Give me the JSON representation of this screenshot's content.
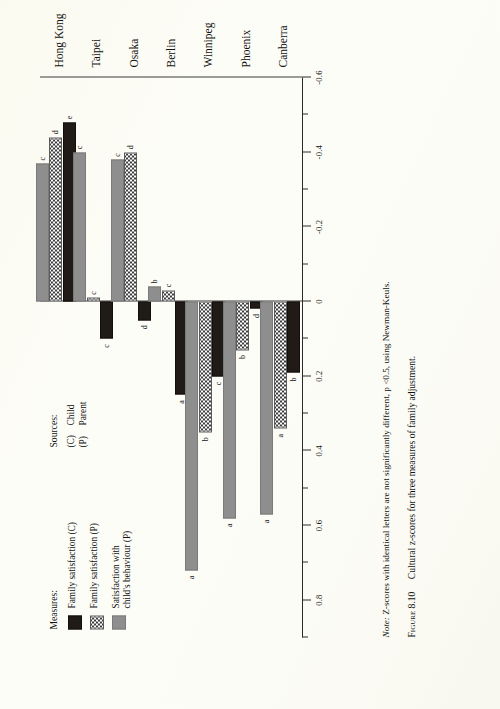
{
  "figure": {
    "number_label": "Figure 8.10",
    "caption": "Cultural z-scores for three measures of family adjustment.",
    "note_prefix": "Note:",
    "note_body": " Z-scores with identical letters are not significantly different, p <0.5, using Newman-Keuls."
  },
  "legend_measures": {
    "title": "Measures:",
    "items": [
      {
        "key": "child",
        "label": "Family satisfaction (C)"
      },
      {
        "key": "parent",
        "label": "Family satisfaction (P)"
      },
      {
        "key": "behaviour",
        "label": "Satisfaction with\nchild's behaviour (P)"
      }
    ]
  },
  "legend_sources": {
    "title": "Sources:",
    "items": [
      {
        "key": "(C)",
        "label": "Child"
      },
      {
        "key": "(P)",
        "label": "Parent"
      }
    ]
  },
  "colors": {
    "child": "#211b18",
    "parent": "#ffffff",
    "behaviour": "#8e8e8e",
    "axis": "#2a2a2a",
    "page": "#fdfdf7"
  },
  "chart_data": {
    "type": "bar",
    "orientation": "horizontal",
    "title": "Cultural z-scores for three measures of family adjustment.",
    "xlabel": "",
    "ylabel": "",
    "axis_ticks": [
      0.8,
      0.6,
      0.4,
      0.2,
      0,
      -0.2,
      -0.4,
      -0.6
    ],
    "axis_tick_labels": [
      "0.8",
      "0.6",
      "0.4",
      "0.2",
      "0",
      "-0.2",
      "-0.4",
      "-0.6"
    ],
    "minor_ticks": [
      0.9,
      0.7,
      0.5,
      0.3,
      0.1,
      -0.1,
      -0.3,
      -0.5
    ],
    "xlim": [
      -0.6,
      0.9
    ],
    "grid": false,
    "legend_position": "left",
    "categories": [
      "Hong Kong",
      "Taipei",
      "Osaka",
      "Berlin",
      "Winnipeg",
      "Phoenix",
      "Canberra"
    ],
    "series": [
      {
        "name": "Family satisfaction (C)",
        "key": "child",
        "values": [
          -0.48,
          0.1,
          0.05,
          0.25,
          0.2,
          0.02,
          0.19
        ],
        "letters": [
          "e",
          "c",
          "d",
          "a",
          "c",
          "d",
          "b"
        ]
      },
      {
        "name": "Family satisfaction (P)",
        "key": "parent",
        "values": [
          -0.44,
          -0.01,
          -0.4,
          -0.03,
          0.35,
          0.13,
          0.34
        ],
        "letters": [
          "d",
          "c",
          "d",
          "c",
          "b",
          "b",
          "a"
        ]
      },
      {
        "name": "Satisfaction with child's behaviour (P)",
        "key": "behaviour",
        "values": [
          -0.37,
          -0.4,
          -0.38,
          -0.04,
          0.72,
          0.58,
          0.57
        ],
        "letters": [
          "c",
          "c",
          "c",
          "b",
          "a",
          "a",
          "a"
        ]
      }
    ]
  }
}
